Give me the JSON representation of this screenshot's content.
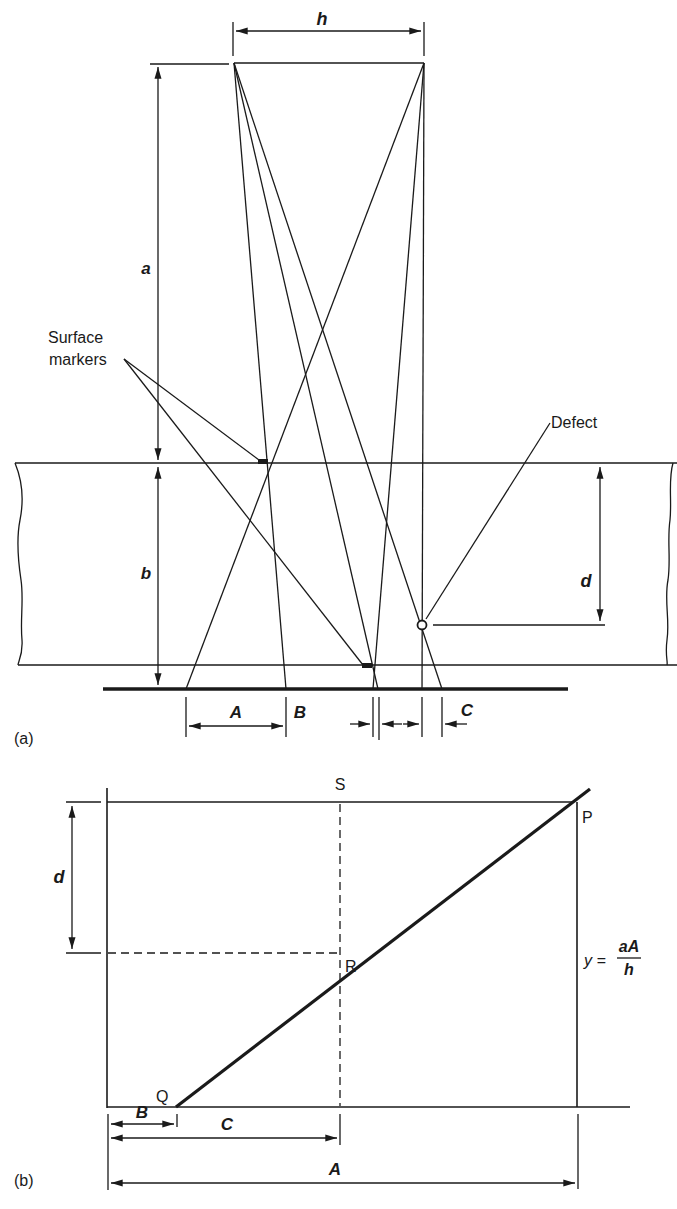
{
  "figure": {
    "panel_a": {
      "label": "(a)",
      "dimensions": {
        "h": "h",
        "a": "a",
        "b": "b",
        "d": "d"
      },
      "annotations": {
        "surface_markers_line1": "Surface",
        "surface_markers_line2": "markers",
        "defect": "Defect"
      },
      "film_measurements": {
        "A": "A",
        "B": "B",
        "C": "C"
      }
    },
    "panel_b": {
      "label": "(b)",
      "points": {
        "S": "S",
        "P": "P",
        "R": "R",
        "Q": "Q"
      },
      "dimension_d": "d",
      "formula": {
        "lhs": "y =",
        "numerator": "aA",
        "denominator": "h"
      },
      "measurements": {
        "B": "B",
        "C": "C",
        "A": "A"
      }
    },
    "colors": {
      "ink": "#1a1a1a",
      "background": "#ffffff"
    }
  }
}
